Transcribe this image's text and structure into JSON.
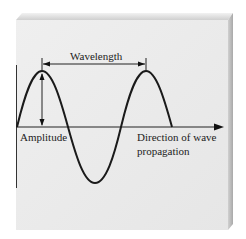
{
  "diagram": {
    "labels": {
      "wavelength": "Wavelength",
      "amplitude": "Amplitude",
      "direction_line1": "Direction of wave",
      "direction_line2": "propagation"
    },
    "colors": {
      "panel_face": "#ebebeb",
      "panel_top": "#d6d6d6",
      "panel_side": "#bdbdbd",
      "line": "#222222"
    }
  }
}
